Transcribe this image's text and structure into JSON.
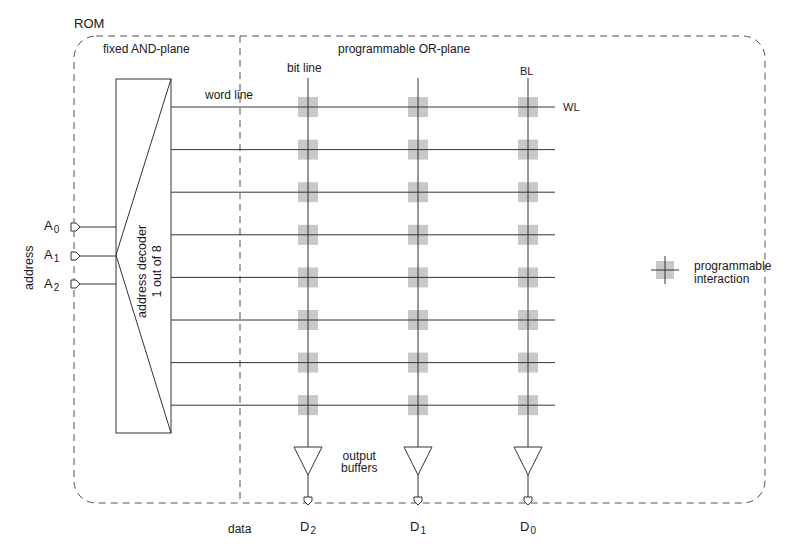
{
  "title": "ROM",
  "planes": {
    "and_plane": "fixed AND-plane",
    "or_plane": "programmable OR-plane"
  },
  "labels": {
    "bit_line": "bit line",
    "bl": "BL",
    "word_line": "word line",
    "wl": "WL",
    "address": "address",
    "decoder_line1": "address decoder",
    "decoder_line2": "1 out of 8",
    "output_buffers_line1": "output",
    "output_buffers_line2": "buffers",
    "data": "data"
  },
  "address_inputs": [
    {
      "name": "A",
      "sub": "0"
    },
    {
      "name": "A",
      "sub": "1"
    },
    {
      "name": "A",
      "sub": "2"
    }
  ],
  "data_outputs": [
    {
      "name": "D",
      "sub": "2"
    },
    {
      "name": "D",
      "sub": "1"
    },
    {
      "name": "D",
      "sub": "0"
    }
  ],
  "grid": {
    "word_lines": 8,
    "bit_lines": 3,
    "cell_color": "#c8c8c8",
    "line_color": "#333333"
  },
  "legend": {
    "line1": "programmable",
    "line2": "interaction"
  }
}
